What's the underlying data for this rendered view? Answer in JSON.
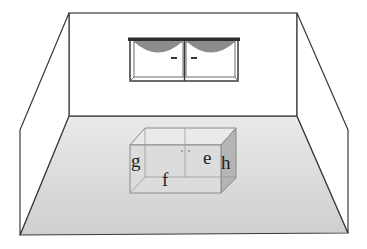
{
  "figure": {
    "colors": {
      "line": "#3a3a3a",
      "floor": "#d4d4d4",
      "box_front": "#dedede",
      "box_top": "#e8e8e8",
      "box_side": "#b5b5b5",
      "cabinet_arc": "#8c8c8c",
      "cabinet_top": "#2e2e2e"
    }
  },
  "labels": {
    "g": "g",
    "f": "f",
    "e": "e",
    "h": "h"
  }
}
